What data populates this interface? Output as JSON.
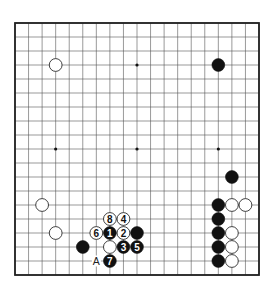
{
  "diagram": {
    "type": "go-board",
    "size": 19,
    "colors": {
      "background": "#ffffff",
      "line": "#555555",
      "border": "#222222",
      "black": "#111111",
      "white": "#ffffff"
    },
    "star_points": [
      [
        3,
        3
      ],
      [
        9,
        3
      ],
      [
        15,
        3
      ],
      [
        3,
        9
      ],
      [
        9,
        9
      ],
      [
        15,
        9
      ],
      [
        3,
        15
      ],
      [
        9,
        15
      ],
      [
        15,
        15
      ]
    ],
    "stones": [
      {
        "col": 3,
        "row": 3,
        "color": "white",
        "label": ""
      },
      {
        "col": 15,
        "row": 3,
        "color": "black",
        "label": ""
      },
      {
        "col": 16,
        "row": 11,
        "color": "black",
        "label": ""
      },
      {
        "col": 15,
        "row": 13,
        "color": "black",
        "label": ""
      },
      {
        "col": 16,
        "row": 13,
        "color": "white",
        "label": ""
      },
      {
        "col": 17,
        "row": 13,
        "color": "white",
        "label": ""
      },
      {
        "col": 15,
        "row": 14,
        "color": "black",
        "label": ""
      },
      {
        "col": 15,
        "row": 15,
        "color": "black",
        "label": ""
      },
      {
        "col": 16,
        "row": 15,
        "color": "white",
        "label": ""
      },
      {
        "col": 15,
        "row": 16,
        "color": "black",
        "label": ""
      },
      {
        "col": 16,
        "row": 16,
        "color": "white",
        "label": ""
      },
      {
        "col": 15,
        "row": 17,
        "color": "black",
        "label": ""
      },
      {
        "col": 16,
        "row": 17,
        "color": "white",
        "label": ""
      },
      {
        "col": 2,
        "row": 13,
        "color": "white",
        "label": ""
      },
      {
        "col": 3,
        "row": 15,
        "color": "white",
        "label": ""
      },
      {
        "col": 5,
        "row": 16,
        "color": "black",
        "label": ""
      },
      {
        "col": 7,
        "row": 14,
        "color": "white",
        "label": "8"
      },
      {
        "col": 8,
        "row": 14,
        "color": "white",
        "label": "4"
      },
      {
        "col": 6,
        "row": 15,
        "color": "white",
        "label": "6"
      },
      {
        "col": 7,
        "row": 15,
        "color": "black",
        "label": "1"
      },
      {
        "col": 8,
        "row": 15,
        "color": "white",
        "label": "2"
      },
      {
        "col": 9,
        "row": 15,
        "color": "black",
        "label": ""
      },
      {
        "col": 7,
        "row": 16,
        "color": "white",
        "label": ""
      },
      {
        "col": 8,
        "row": 16,
        "color": "black",
        "label": "3"
      },
      {
        "col": 9,
        "row": 16,
        "color": "black",
        "label": "5"
      },
      {
        "col": 7,
        "row": 17,
        "color": "black",
        "label": "7"
      }
    ],
    "markers": [
      {
        "col": 6,
        "row": 17,
        "label": "A"
      }
    ]
  }
}
